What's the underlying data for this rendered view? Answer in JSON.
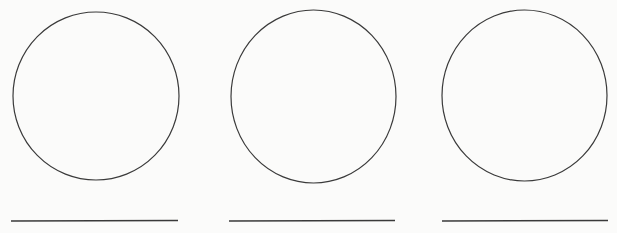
{
  "page": {
    "width": 617,
    "height": 233,
    "background_color": "#fbfbfa",
    "ink_color": "#3a3a3a",
    "text_content": "",
    "element_count": "6"
  },
  "chart_data": {
    "type": "scatter",
    "title": "",
    "xlabel": "",
    "ylabel": "",
    "xlim": [
      0,
      617
    ],
    "ylim": [
      0,
      233
    ],
    "grid": false,
    "legend": "none",
    "shapes": [
      {
        "id": "circle-1",
        "kind": "ellipse",
        "cx": 96,
        "cy": 96,
        "rx": 83,
        "ry": 84,
        "stroke": "#3a3a3a",
        "stroke_width": 1.2,
        "fill": "none"
      },
      {
        "id": "circle-2",
        "kind": "ellipse",
        "cx": 313.5,
        "cy": 96.5,
        "rx": 82.5,
        "ry": 86.5,
        "stroke": "#3a3a3a",
        "stroke_width": 1.2,
        "fill": "none"
      },
      {
        "id": "circle-3",
        "kind": "ellipse",
        "cx": 524.5,
        "cy": 95.5,
        "rx": 82.5,
        "ry": 85.5,
        "stroke": "#3a3a3a",
        "stroke_width": 1.2,
        "fill": "none"
      },
      {
        "id": "line-1",
        "kind": "line",
        "x1": 11,
        "y1": 221,
        "x2": 178,
        "y2": 220.5,
        "stroke": "#3a3a3a",
        "stroke_width": 1.6
      },
      {
        "id": "line-2",
        "kind": "line",
        "x1": 229,
        "y1": 221,
        "x2": 395,
        "y2": 220.5,
        "stroke": "#3a3a3a",
        "stroke_width": 1.6
      },
      {
        "id": "line-3",
        "kind": "line",
        "x1": 442,
        "y1": 221,
        "x2": 608,
        "y2": 220.5,
        "stroke": "#3a3a3a",
        "stroke_width": 1.6
      }
    ]
  }
}
